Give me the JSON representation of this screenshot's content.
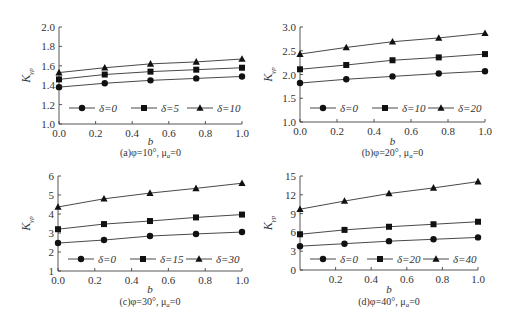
{
  "chart_data": [
    {
      "id": "a",
      "type": "line",
      "caption": "(a)φ=10°,  μ",
      "caption_sub": "a",
      "caption_tail": "=0",
      "xlabel": "b",
      "ylabel": "K",
      "ylabel_sub": "γp",
      "x": [
        0.0,
        0.25,
        0.5,
        0.75,
        1.0
      ],
      "xticks": [
        "0.0",
        "0.2",
        "0.4",
        "0.6",
        "0.8",
        "1.0"
      ],
      "xtick_values": [
        0.0,
        0.2,
        0.4,
        0.6,
        0.8,
        1.0
      ],
      "yticks": [
        "1.0",
        "1.2",
        "1.4",
        "1.6",
        "1.8",
        "2.0"
      ],
      "ytick_values": [
        1.0,
        1.2,
        1.4,
        1.6,
        1.8,
        2.0
      ],
      "ylim": [
        1.0,
        2.0
      ],
      "xlim": [
        0.0,
        1.0
      ],
      "grid": false,
      "legend_position": "inside-bottom",
      "series": [
        {
          "name": "δ=0",
          "marker": "diamond",
          "values": [
            1.38,
            1.42,
            1.45,
            1.47,
            1.49
          ]
        },
        {
          "name": "δ=5",
          "marker": "square",
          "values": [
            1.46,
            1.51,
            1.54,
            1.56,
            1.58
          ]
        },
        {
          "name": "δ=10",
          "marker": "triangle",
          "values": [
            1.53,
            1.58,
            1.62,
            1.64,
            1.67
          ]
        }
      ]
    },
    {
      "id": "b",
      "type": "line",
      "caption": "(b)φ=20°,  μ",
      "caption_sub": "a",
      "caption_tail": "=0",
      "xlabel": "b",
      "ylabel": "K",
      "ylabel_sub": "γp",
      "x": [
        0.0,
        0.25,
        0.5,
        0.75,
        1.0
      ],
      "xticks": [
        "0.0",
        "0.2",
        "0.4",
        "0.6",
        "0.8",
        "1.0"
      ],
      "xtick_values": [
        0.0,
        0.2,
        0.4,
        0.6,
        0.8,
        1.0
      ],
      "yticks": [
        "1.0",
        "1.5",
        "2.0",
        "2.5",
        "3.0"
      ],
      "ytick_values": [
        1.0,
        1.5,
        2.0,
        2.5,
        3.0
      ],
      "ylim": [
        1.0,
        3.0
      ],
      "xlim": [
        0.0,
        1.0
      ],
      "grid": false,
      "legend_position": "inside-bottom",
      "series": [
        {
          "name": "δ=0",
          "marker": "diamond",
          "values": [
            1.82,
            1.9,
            1.96,
            2.02,
            2.07
          ]
        },
        {
          "name": "δ=10",
          "marker": "square",
          "values": [
            2.11,
            2.2,
            2.3,
            2.36,
            2.43
          ]
        },
        {
          "name": "δ=20",
          "marker": "triangle",
          "values": [
            2.43,
            2.57,
            2.69,
            2.77,
            2.87
          ]
        }
      ]
    },
    {
      "id": "c",
      "type": "line",
      "caption": "(c)φ=30°,  μ",
      "caption_sub": "a",
      "caption_tail": "=0",
      "xlabel": "b",
      "ylabel": "K",
      "ylabel_sub": "γp",
      "x": [
        0.0,
        0.25,
        0.5,
        0.75,
        1.0
      ],
      "xticks": [
        "0.0",
        "0.2",
        "0.4",
        "0.6",
        "0.8",
        "1.0"
      ],
      "xtick_values": [
        0.0,
        0.2,
        0.4,
        0.6,
        0.8,
        1.0
      ],
      "yticks": [
        "1",
        "2",
        "3",
        "4",
        "5",
        "6"
      ],
      "ytick_values": [
        1,
        2,
        3,
        4,
        5,
        6
      ],
      "ylim": [
        1,
        6
      ],
      "xlim": [
        0.0,
        1.0
      ],
      "grid": false,
      "legend_position": "inside-bottom",
      "series": [
        {
          "name": "δ=0",
          "marker": "diamond",
          "values": [
            2.47,
            2.63,
            2.84,
            2.95,
            3.05
          ]
        },
        {
          "name": "δ=15",
          "marker": "square",
          "values": [
            3.2,
            3.47,
            3.63,
            3.82,
            3.97
          ]
        },
        {
          "name": "δ=30",
          "marker": "triangle",
          "values": [
            4.37,
            4.8,
            5.1,
            5.35,
            5.62
          ]
        }
      ]
    },
    {
      "id": "d",
      "type": "line",
      "caption": "(d)φ=40°,  μ",
      "caption_sub": "a",
      "caption_tail": "=0",
      "xlabel": "b",
      "ylabel": "K",
      "ylabel_sub": "γp",
      "x": [
        0.0,
        0.25,
        0.5,
        0.75,
        1.0
      ],
      "xticks": [
        "0.2",
        "0.4",
        "0.6",
        "0.8",
        "1.0"
      ],
      "xtick_values": [
        0.2,
        0.4,
        0.6,
        0.8,
        1.0
      ],
      "yticks": [
        "0",
        "3",
        "6",
        "9",
        "12",
        "15"
      ],
      "ytick_values": [
        0,
        3,
        6,
        9,
        12,
        15
      ],
      "ylim": [
        0,
        15
      ],
      "xlim": [
        0.0,
        1.0
      ],
      "grid": false,
      "legend_position": "inside-bottom",
      "series": [
        {
          "name": "δ=0",
          "marker": "diamond",
          "values": [
            3.8,
            4.2,
            4.6,
            4.9,
            5.2
          ]
        },
        {
          "name": "δ=20",
          "marker": "square",
          "values": [
            5.7,
            6.4,
            6.9,
            7.3,
            7.7
          ]
        },
        {
          "name": "δ=40",
          "marker": "triangle",
          "values": [
            9.7,
            11.0,
            12.2,
            13.1,
            14.1
          ]
        }
      ]
    }
  ]
}
